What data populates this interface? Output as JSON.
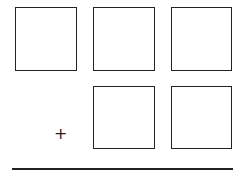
{
  "diagram": {
    "operator": "+",
    "rows": [
      {
        "name": "top-addend",
        "box_count": 3
      },
      {
        "name": "bottom-addend",
        "box_count": 2
      }
    ],
    "colors": {
      "stroke": "#222222",
      "background": "#ffffff"
    }
  }
}
